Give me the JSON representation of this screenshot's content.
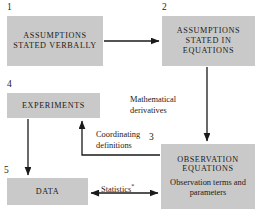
{
  "diagram": {
    "fill_color": "#c9c9c9",
    "line_color": "#1a1a1a",
    "background": "#ffffff",
    "nodes": [
      {
        "id": "1",
        "number": "1",
        "caps": "ASSUMPTIONS STATED VERBALLY",
        "sub": ""
      },
      {
        "id": "2",
        "number": "2",
        "caps": "ASSUMPTIONS STATED IN EQUATIONS",
        "sub": ""
      },
      {
        "id": "3",
        "number": "3",
        "caps": "OBSERVATION EQUATIONS",
        "sub": "Observation terms and parameters"
      },
      {
        "id": "4",
        "number": "4",
        "caps": "EXPERIMENTS",
        "sub": ""
      },
      {
        "id": "5",
        "number": "5",
        "caps": "DATA",
        "sub": ""
      }
    ],
    "edges": [
      {
        "id": "e1",
        "from": "1",
        "to": "2",
        "label": "",
        "heads": "one"
      },
      {
        "id": "e2",
        "from": "2",
        "to": "3",
        "label": "Mathematical derivatives",
        "heads": "one"
      },
      {
        "id": "e3",
        "from": "3",
        "to": "4",
        "label": "Coordinating definitions",
        "heads": "one"
      },
      {
        "id": "e4",
        "from": "4",
        "to": "5",
        "label": "",
        "heads": "one"
      },
      {
        "id": "e5",
        "from": "5",
        "to": "3",
        "label": "Statistics",
        "label_mark": "*",
        "heads": "both"
      }
    ],
    "labels": {
      "mathematical_line1": "Mathematical",
      "mathematical_line2": "derivatives",
      "coordinating_line1": "Coordinating",
      "coordinating_line2": "definitions",
      "statistics": "Statistics",
      "statistics_mark": "*"
    }
  }
}
